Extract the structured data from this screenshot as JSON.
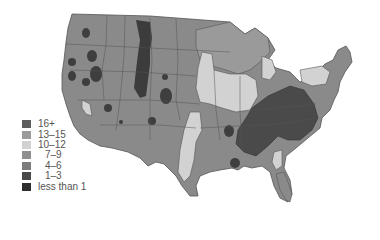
{
  "map": {
    "region": "Contiguous United States",
    "base_color": "#8a8a8a",
    "border_color": "#555555"
  },
  "legend": {
    "items": [
      {
        "label": "16+",
        "color": "#5e5e5e"
      },
      {
        "label": "13–15",
        "color": "#9a9a9a"
      },
      {
        "label": "10–12",
        "color": "#d2d2d2"
      },
      {
        "label": "7–9",
        "color": "#8f8f8f"
      },
      {
        "label": "4–6",
        "color": "#7c7c7c"
      },
      {
        "label": "1–3",
        "color": "#4a4a4a"
      },
      {
        "label": "less than 1",
        "color": "#2e2e2e"
      }
    ]
  }
}
